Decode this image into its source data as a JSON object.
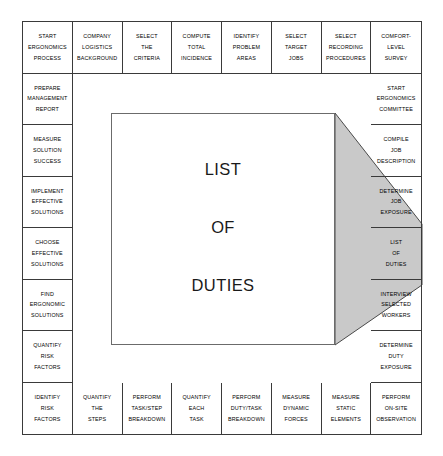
{
  "diagram": {
    "highlight_color": "#c9c9c9",
    "border_color": "#3a3a3a",
    "background_color": "#ffffff"
  },
  "magnifier": {
    "source_cell": "list-of-duties",
    "lines": [
      "LIST",
      "OF",
      "DUTIES"
    ]
  },
  "grid": {
    "columns": 8,
    "rows": 8,
    "cells": {
      "top": [
        {
          "id": "start-ergonomics-process",
          "lines": [
            "START",
            "ERGONOMICS",
            "PROCESS"
          ]
        },
        {
          "id": "company-logistics-background",
          "lines": [
            "COMPANY",
            "LOGISTICS",
            "BACKGROUND"
          ]
        },
        {
          "id": "select-the-criteria",
          "lines": [
            "SELECT",
            "THE",
            "CRITERIA"
          ]
        },
        {
          "id": "compute-total-incidence",
          "lines": [
            "COMPUTE",
            "TOTAL",
            "INCIDENCE"
          ]
        },
        {
          "id": "identify-problem-areas",
          "lines": [
            "IDENTIFY",
            "PROBLEM",
            "AREAS"
          ]
        },
        {
          "id": "select-target-jobs",
          "lines": [
            "SELECT",
            "TARGET",
            "JOBS"
          ]
        },
        {
          "id": "select-recording-procedures",
          "lines": [
            "SELECT",
            "RECORDING",
            "PROCEDURES"
          ]
        },
        {
          "id": "comfort-level-survey",
          "lines": [
            "COMFORT-",
            "LEVEL",
            "SURVEY"
          ]
        }
      ],
      "left": [
        {
          "id": "prepare-management-report",
          "lines": [
            "PREPARE",
            "MANAGEMENT",
            "REPORT"
          ]
        },
        {
          "id": "measure-solution-success",
          "lines": [
            "MEASURE",
            "SOLUTION",
            "SUCCESS"
          ]
        },
        {
          "id": "implement-effective-solutions",
          "lines": [
            "IMPLEMENT",
            "EFFECTIVE",
            "SOLUTIONS"
          ]
        },
        {
          "id": "choose-effective-solutions",
          "lines": [
            "CHOOSE",
            "EFFECTIVE",
            "SOLUTIONS"
          ]
        },
        {
          "id": "find-ergonomic-solutions",
          "lines": [
            "FIND",
            "ERGONOMIC",
            "SOLUTIONS"
          ]
        },
        {
          "id": "quantify-risk-factors",
          "lines": [
            "QUANTIFY",
            "RISK",
            "FACTORS"
          ]
        }
      ],
      "right": [
        {
          "id": "start-ergonomics-committee",
          "lines": [
            "START",
            "ERGONOMICS",
            "COMMITTEE"
          ],
          "highlighted": false
        },
        {
          "id": "compile-job-description",
          "lines": [
            "COMPILE",
            "JOB",
            "DESCRIPTION"
          ],
          "highlighted": false
        },
        {
          "id": "determine-job-exposure",
          "lines": [
            "DETERMINE",
            "JOB",
            "EXPOSURE"
          ],
          "highlighted": true
        },
        {
          "id": "list-of-duties",
          "lines": [
            "LIST",
            "OF",
            "DUTIES"
          ],
          "highlighted": true
        },
        {
          "id": "interview-selected-workers",
          "lines": [
            "INTERVIEW",
            "SELECTED",
            "WORKERS"
          ],
          "highlighted": true
        },
        {
          "id": "determine-duty-exposure",
          "lines": [
            "DETERMINE",
            "DUTY",
            "EXPOSURE"
          ],
          "highlighted": false
        }
      ],
      "bottom": [
        {
          "id": "identify-risk-factors",
          "lines": [
            "IDENTIFY",
            "RISK",
            "FACTORS"
          ]
        },
        {
          "id": "quantify-the-steps",
          "lines": [
            "QUANTIFY",
            "THE",
            "STEPS"
          ]
        },
        {
          "id": "perform-task-step-breakdown",
          "lines": [
            "PERFORM",
            "TASK/STEP",
            "BREAKDOWN"
          ]
        },
        {
          "id": "quantify-each-task",
          "lines": [
            "QUANTIFY",
            "EACH",
            "TASK"
          ]
        },
        {
          "id": "perform-duty-task-breakdown",
          "lines": [
            "PERFORM",
            "DUTY/TASK",
            "BREAKDOWN"
          ]
        },
        {
          "id": "measure-dynamic-forces",
          "lines": [
            "MEASURE",
            "DYNAMIC",
            "FORCES"
          ]
        },
        {
          "id": "measure-static-elements",
          "lines": [
            "MEASURE",
            "STATIC",
            "ELEMENTS"
          ]
        },
        {
          "id": "perform-on-site-observation",
          "lines": [
            "PERFORM",
            "ON-SITE",
            "OBSERVATION"
          ]
        }
      ]
    }
  }
}
